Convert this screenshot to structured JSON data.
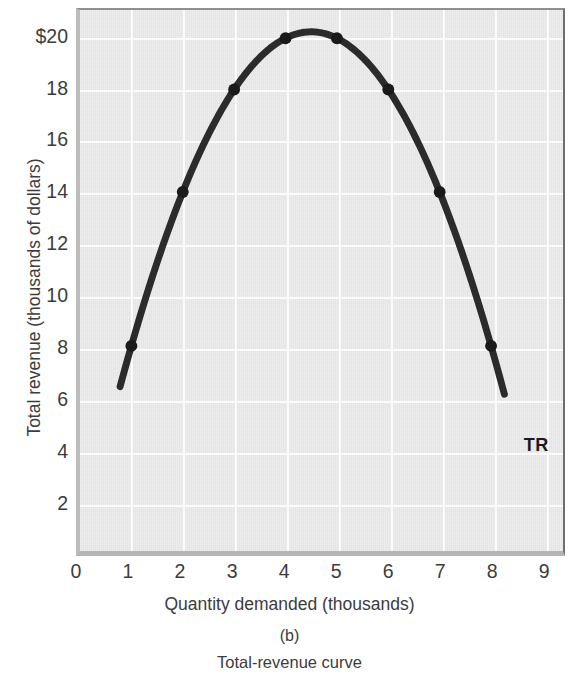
{
  "chart_data": {
    "type": "line",
    "title": "Total-revenue curve",
    "panel_label": "(b)",
    "xlabel": "Quantity demanded (thousands)",
    "ylabel": "Total revenue (thousands of dollars)",
    "series_label": "TR",
    "xlim": [
      0,
      9.4
    ],
    "ylim": [
      0,
      21.1
    ],
    "grid": true,
    "legend_position": "inline-right",
    "x_ticks": [
      "0",
      "1",
      "2",
      "3",
      "4",
      "5",
      "6",
      "7",
      "8",
      "9"
    ],
    "x_tick_values": [
      0,
      1,
      2,
      3,
      4,
      5,
      6,
      7,
      8,
      9
    ],
    "y_ticks": [
      "2",
      "4",
      "6",
      "8",
      "10",
      "12",
      "14",
      "16",
      "18",
      "$20"
    ],
    "y_tick_values": [
      2,
      4,
      6,
      8,
      10,
      12,
      14,
      16,
      18,
      20
    ],
    "x": [
      1,
      2,
      3,
      4,
      5,
      6,
      7,
      8
    ],
    "values": [
      8,
      14,
      18,
      20,
      20,
      18,
      14,
      8
    ],
    "curve_start": [
      0.78,
      5
    ],
    "curve_end": [
      8.26,
      5
    ],
    "curve_vertex": [
      4.5,
      20.25
    ],
    "curve_color": "#2b2b2b",
    "plot_background": "#e4e4e4",
    "grid_color": "#fbfbfb",
    "marker_color": "#1a1a1a"
  }
}
